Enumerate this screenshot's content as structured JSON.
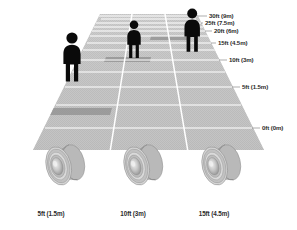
{
  "diagram": {
    "background_color": "#ffffff",
    "floor_color": "#c9c9c9",
    "lane_divider_color": "#ffffff",
    "person_color": "#0a0a0a",
    "label_color": "#2b2b2b",
    "leader_line_color": "#8a8a8a"
  },
  "distance_markers": [
    {
      "id": "m30",
      "label": "30ft (9m)",
      "feet": 30,
      "meters": 9.0
    },
    {
      "id": "m25",
      "label": "25ft (7.5m)",
      "feet": 25,
      "meters": 7.5
    },
    {
      "id": "m20",
      "label": "20ft (6m)",
      "feet": 20,
      "meters": 6.0
    },
    {
      "id": "m15",
      "label": "15ft (4.5m)",
      "feet": 15,
      "meters": 4.5
    },
    {
      "id": "m10",
      "label": "10ft (3m)",
      "feet": 10,
      "meters": 3.0
    },
    {
      "id": "m5",
      "label": "5ft (1.5m)",
      "feet": 5,
      "meters": 1.5
    },
    {
      "id": "m0",
      "label": "0ft (0m)",
      "feet": 0,
      "meters": 0.0
    }
  ],
  "lenses": [
    {
      "id": "lens-left",
      "label": "5ft (1.5m)",
      "feet": 5,
      "meters": 1.5
    },
    {
      "id": "lens-center",
      "label": "10ft (3m)",
      "feet": 10,
      "meters": 3.0
    },
    {
      "id": "lens-right",
      "label": "15ft (4.5m)",
      "feet": 15,
      "meters": 4.5
    }
  ],
  "figures": [
    {
      "id": "figure-near",
      "lane": "left",
      "standing_at": "5ft (1.5m)"
    },
    {
      "id": "figure-mid",
      "lane": "center",
      "standing_at": "10ft (3m)"
    },
    {
      "id": "figure-far",
      "lane": "right",
      "standing_at": "15ft (4.5m)"
    }
  ]
}
